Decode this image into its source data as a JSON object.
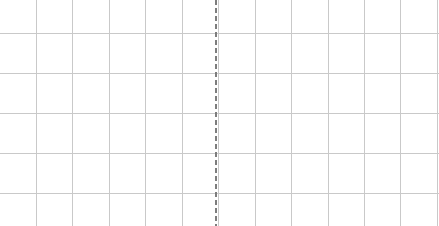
{
  "figure": {
    "title": "",
    "width_px": 439,
    "height_px": 226,
    "background_color": "#ffffff"
  },
  "chart_data": {
    "type": "line",
    "title": "",
    "subtitle": "",
    "xlabel": "",
    "ylabel": "",
    "x": [],
    "series": [],
    "categories": [],
    "values": [],
    "xlim": [
      0,
      439
    ],
    "ylim": [
      0,
      226
    ],
    "grid": {
      "enabled": true,
      "color": "#c9c9c9",
      "line_width_px": 1,
      "vertical_positions_px": [
        36,
        72,
        109,
        145,
        182,
        218,
        255,
        291,
        328,
        364,
        400,
        437
      ],
      "horizontal_positions_px": [
        33,
        73,
        113,
        153,
        193
      ],
      "vertical_spacing_px": 36.4,
      "horizontal_spacing_px": 40
    },
    "legend": {
      "visible": false,
      "position": "none",
      "entries": []
    },
    "axes": {
      "x_ticks": [],
      "y_ticks": [],
      "x_tick_labels": [],
      "y_tick_labels": [],
      "spines_visible": false
    },
    "annotations": [
      {
        "name": "vertical-marker",
        "type": "vline",
        "x_px": 215,
        "label": "",
        "color": "#7d7d7d",
        "line_style": "dashed",
        "line_width_px": 2,
        "dash_length_px": 5,
        "gap_length_px": 3,
        "spans_full_height": true
      }
    ]
  },
  "colors": {
    "grid": "#c9c9c9",
    "marker": "#7d7d7d",
    "background": "#ffffff"
  }
}
